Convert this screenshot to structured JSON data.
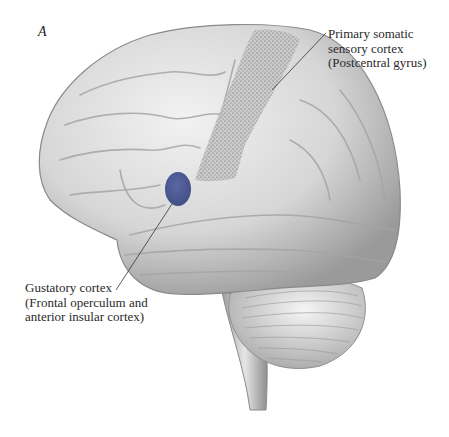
{
  "figure": {
    "panel_letter": "A",
    "colors": {
      "gustatory_highlight": "#3e4d8e",
      "brain_fill": "#d9d9d9",
      "outline": "#8a8a8a",
      "leader_line": "#333333",
      "text": "#2a2a2a"
    },
    "labels": [
      {
        "id": "primary-somatic",
        "lines": [
          "Primary somatic",
          "sensory cortex",
          "(Postcentral gyrus)"
        ]
      },
      {
        "id": "gustatory",
        "lines": [
          "Gustatory cortex",
          "(Frontal operculum and",
          "anterior insular cortex)"
        ]
      }
    ]
  }
}
